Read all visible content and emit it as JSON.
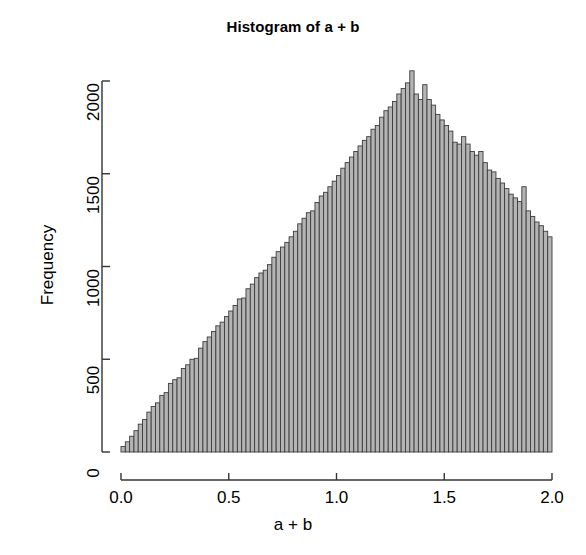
{
  "figure": {
    "title": "Histogram of a + b",
    "background_color": "#ffffff",
    "axis_color": "#333333",
    "text_color": "#000000"
  },
  "chart_data": {
    "type": "bar",
    "title": "Histogram of a + b",
    "xlabel": "a + b",
    "ylabel": "Frequency",
    "xlim": [
      0.0,
      2.0
    ],
    "ylim": [
      0,
      2100
    ],
    "grid": false,
    "legend": null,
    "bar_fill_color": "#b4b4b4",
    "bar_border_color": "#3c3c3c",
    "bin_width": 0.02,
    "x_ticks": [
      0.0,
      0.5,
      1.0,
      1.5,
      2.0
    ],
    "x_tick_labels": [
      "0.0",
      "0.5",
      "1.0",
      "1.5",
      "2.0"
    ],
    "y_ticks": [
      0,
      500,
      1000,
      1500,
      2000
    ],
    "y_tick_labels": [
      "0",
      "500",
      "1000",
      "1500",
      "2000"
    ],
    "bin_centers": [
      0.01,
      0.03,
      0.05,
      0.07,
      0.09,
      0.11,
      0.13,
      0.15,
      0.17,
      0.19,
      0.21,
      0.23,
      0.25,
      0.27,
      0.29,
      0.31,
      0.33,
      0.35,
      0.37,
      0.39,
      0.41,
      0.43,
      0.45,
      0.47,
      0.49,
      0.51,
      0.53,
      0.55,
      0.57,
      0.59,
      0.61,
      0.63,
      0.65,
      0.67,
      0.69,
      0.71,
      0.73,
      0.75,
      0.77,
      0.79,
      0.81,
      0.83,
      0.85,
      0.87,
      0.89,
      0.91,
      0.93,
      0.95,
      0.97,
      0.99,
      1.01,
      1.03,
      1.05,
      1.07,
      1.09,
      1.11,
      1.13,
      1.15,
      1.17,
      1.19,
      1.21,
      1.23,
      1.25,
      1.27,
      1.29,
      1.31,
      1.33,
      1.35,
      1.37,
      1.39,
      1.41,
      1.43,
      1.45,
      1.47,
      1.49,
      1.51,
      1.53,
      1.55,
      1.57,
      1.59,
      1.61,
      1.63,
      1.65,
      1.67,
      1.69,
      1.71,
      1.73,
      1.75,
      1.77,
      1.79,
      1.81,
      1.83,
      1.85,
      1.87,
      1.89,
      1.91,
      1.93,
      1.95,
      1.97,
      1.99
    ],
    "values": [
      30,
      55,
      85,
      115,
      150,
      175,
      215,
      245,
      265,
      305,
      320,
      370,
      390,
      400,
      450,
      470,
      500,
      505,
      560,
      595,
      620,
      650,
      680,
      700,
      730,
      760,
      790,
      825,
      830,
      880,
      905,
      940,
      965,
      980,
      1010,
      1050,
      1080,
      1105,
      1130,
      1160,
      1190,
      1230,
      1260,
      1290,
      1300,
      1345,
      1380,
      1400,
      1430,
      1460,
      1490,
      1530,
      1560,
      1590,
      1620,
      1650,
      1680,
      1700,
      1740,
      1760,
      1805,
      1840,
      1860,
      1890,
      1930,
      1960,
      1990,
      2055,
      1930,
      1900,
      1980,
      1900,
      1870,
      1820,
      1790,
      1760,
      1730,
      1670,
      1660,
      1700,
      1660,
      1620,
      1600,
      1620,
      1560,
      1520,
      1510,
      1475,
      1450,
      1420,
      1390,
      1370,
      1350,
      1430,
      1300,
      1270,
      1240,
      1220,
      1190,
      1160
    ]
  },
  "plot_geometry": {
    "plot_left_px": 121,
    "plot_right_px": 552,
    "plot_baseline_px": 452,
    "plot_top_px": 72
  }
}
